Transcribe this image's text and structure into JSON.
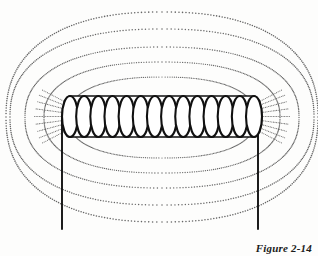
{
  "figure": {
    "caption": "Figure 2-14",
    "background_color": "#fdfdfc",
    "ink_color": "#111111",
    "field_line_color": "#555555"
  },
  "coil": {
    "name": "solenoid-coil",
    "turns": 14,
    "left_x": 62,
    "right_x": 262,
    "top_y": 96,
    "bottom_y": 137,
    "stroke_width": 2.1,
    "loop_rx": 8.0,
    "loop_ry": 20.5
  },
  "leads": [
    {
      "name": "lead-wire-left",
      "x": 62,
      "y_top": 116,
      "y_bottom": 229
    },
    {
      "name": "lead-wire-right",
      "x": 258,
      "y_top": 116,
      "y_bottom": 229
    }
  ],
  "field_lines": {
    "count": 5,
    "style": "dotted",
    "description": "nested closed loops encircling the solenoid, symmetric above and below",
    "loops": [
      {
        "index": 0,
        "half_width": 94,
        "top_y": 77,
        "bottom_y": 158,
        "dot_size": 0.62
      },
      {
        "index": 1,
        "half_width": 118,
        "top_y": 62,
        "bottom_y": 173,
        "dot_size": 0.66
      },
      {
        "index": 2,
        "half_width": 137,
        "top_y": 47,
        "bottom_y": 188,
        "dot_size": 0.7
      },
      {
        "index": 3,
        "half_width": 152,
        "top_y": 29,
        "bottom_y": 205,
        "dot_size": 0.74
      },
      {
        "index": 4,
        "half_width": 156,
        "top_y": 12,
        "bottom_y": 222,
        "dot_size": 0.78
      }
    ]
  },
  "end_flux": {
    "name": "coil-end-flux-strokes",
    "description": "short dotted strokes fanning out from each end of the coil",
    "strokes_per_end": 9
  },
  "chart_data": {
    "type": "diagram",
    "title": "Figure 2-14",
    "elements": [
      "solenoid-coil",
      "lead-wire-left",
      "lead-wire-right",
      "magnetic-field-lines"
    ]
  }
}
